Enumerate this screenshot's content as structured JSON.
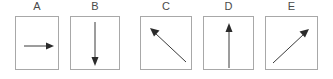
{
  "figure": {
    "background_color": "#ffffff",
    "box_border_color": "#a8a8a8",
    "arrow_color": "#2b2b2b",
    "label_color": "#4a4a4a",
    "panels": [
      {
        "label": "A",
        "arrow_name": "arrow-right",
        "direction": "right",
        "description": "horizontal arrow pointing right",
        "x": 15,
        "y": 16,
        "width": 44,
        "height": 54,
        "tail": {
          "x": 9,
          "y": 30
        },
        "head": {
          "x": 38,
          "y": 30
        }
      },
      {
        "label": "B",
        "arrow_name": "arrow-down",
        "direction": "down",
        "description": "vertical arrow pointing down",
        "x": 70,
        "y": 16,
        "width": 50,
        "height": 54,
        "tail": {
          "x": 25,
          "y": 6
        },
        "head": {
          "x": 25,
          "y": 49
        }
      },
      {
        "label": "C",
        "arrow_name": "arrow-up-left",
        "direction": "up-left",
        "description": "diagonal arrow pointing up and to the left",
        "x": 140,
        "y": 16,
        "width": 52,
        "height": 54,
        "tail": {
          "x": 46,
          "y": 46
        },
        "head": {
          "x": 11,
          "y": 13
        }
      },
      {
        "label": "D",
        "arrow_name": "arrow-up",
        "direction": "up",
        "description": "vertical arrow pointing up",
        "x": 203,
        "y": 16,
        "width": 51,
        "height": 54,
        "tail": {
          "x": 26,
          "y": 51
        },
        "head": {
          "x": 26,
          "y": 8
        }
      },
      {
        "label": "E",
        "arrow_name": "arrow-up-right",
        "direction": "up-right",
        "description": "diagonal arrow pointing up and to the right",
        "x": 265,
        "y": 16,
        "width": 53,
        "height": 54,
        "tail": {
          "x": 8,
          "y": 47
        },
        "head": {
          "x": 43,
          "y": 14
        }
      }
    ]
  }
}
